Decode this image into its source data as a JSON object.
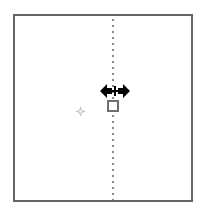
{
  "canvas": {
    "background": "#ffffff",
    "frame_border_color": "#666666",
    "guide_color": "#888888"
  },
  "guide": {
    "orientation": "vertical",
    "style": "dotted"
  },
  "cursor": {
    "icon": "resize-horizontal-cursor-icon",
    "color": "#000000"
  },
  "handle": {
    "icon": "square-handle-icon",
    "color": "#6f6f6f"
  },
  "marker": {
    "icon": "sparkle-icon",
    "color": "#b0b0b0"
  }
}
